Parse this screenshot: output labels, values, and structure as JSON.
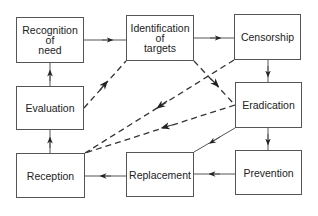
{
  "diagram": {
    "type": "flow-cycle",
    "nodes": {
      "recognition": {
        "label": "Recognition\nof\nneed"
      },
      "identification": {
        "label": "Identification\nof\ntargets"
      },
      "censorship": {
        "label": "Censorship"
      },
      "evaluation": {
        "label": "Evaluation"
      },
      "eradication": {
        "label": "Eradication"
      },
      "reception": {
        "label": "Reception"
      },
      "replacement": {
        "label": "Replacement"
      },
      "prevention": {
        "label": "Prevention"
      }
    },
    "edges": [
      {
        "from": "Recognition of need",
        "to": "Identification of targets",
        "style": "solid"
      },
      {
        "from": "Identification of targets",
        "to": "Censorship",
        "style": "solid"
      },
      {
        "from": "Censorship",
        "to": "Eradication",
        "style": "solid"
      },
      {
        "from": "Eradication",
        "to": "Prevention",
        "style": "solid"
      },
      {
        "from": "Prevention",
        "to": "Replacement",
        "style": "solid"
      },
      {
        "from": "Replacement",
        "to": "Reception",
        "style": "solid"
      },
      {
        "from": "Reception",
        "to": "Evaluation",
        "style": "solid"
      },
      {
        "from": "Evaluation",
        "to": "Recognition of need",
        "style": "solid"
      },
      {
        "from": "Identification of targets",
        "to": "Eradication",
        "style": "dashed"
      },
      {
        "from": "Evaluation",
        "to": "Identification of targets",
        "style": "dashed"
      },
      {
        "from": "Censorship",
        "to": "Reception",
        "style": "dashed"
      },
      {
        "from": "Eradication",
        "to": "Reception",
        "style": "dashed"
      },
      {
        "from": "Eradication",
        "to": "Replacement",
        "style": "solid"
      }
    ],
    "colors": {
      "line": "#333333",
      "border": "#555555",
      "text": "#222222"
    }
  }
}
